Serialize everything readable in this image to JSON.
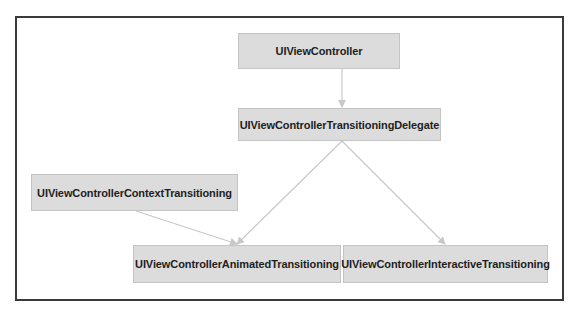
{
  "diagram": {
    "type": "class-relationship",
    "nodes": [
      {
        "id": "vc",
        "label": "UIViewController"
      },
      {
        "id": "delegate",
        "label": "UIViewControllerTransitioningDelegate"
      },
      {
        "id": "context",
        "label": "UIViewControllerContextTransitioning"
      },
      {
        "id": "animated",
        "label": "UIViewControllerAnimatedTransitioning"
      },
      {
        "id": "interactive",
        "label": "UIViewControllerInteractiveTransitioning"
      }
    ],
    "edges": [
      {
        "from": "vc",
        "to": "delegate"
      },
      {
        "from": "delegate",
        "to": "animated"
      },
      {
        "from": "delegate",
        "to": "interactive"
      },
      {
        "from": "context",
        "to": "animated"
      }
    ],
    "colors": {
      "node_fill": "#dcdcdc",
      "node_border": "#c4c4c4",
      "edge": "#c8c8c8",
      "frame": "#3a3a3a"
    }
  }
}
